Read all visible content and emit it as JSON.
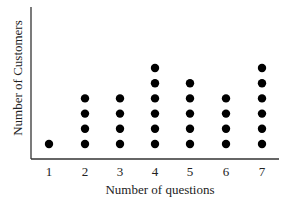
{
  "chart_data": {
    "type": "scatter",
    "subtype": "dot_plot",
    "title": "",
    "xlabel": "Number of questions",
    "ylabel": "Number of Customers",
    "categories": [
      "1",
      "2",
      "3",
      "4",
      "5",
      "6",
      "7"
    ],
    "values": [
      1,
      4,
      4,
      6,
      5,
      4,
      6
    ],
    "grid": false,
    "legend": null,
    "dot_color": "#000000"
  }
}
